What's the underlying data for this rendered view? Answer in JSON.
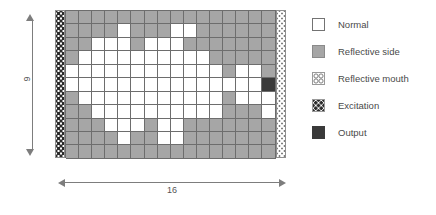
{
  "diagram": {
    "width_label": "16",
    "height_label": "9",
    "colors": {
      "normal": "#ffffff",
      "reflective_side": "#a6a6a6",
      "output": "#3a3a3a",
      "grid_line": "#6d6d6d",
      "arrow": "#7d7d7d"
    },
    "grid": {
      "columns": 16,
      "rows": 11,
      "left_strip": "excitation",
      "right_strip": "reflective-mouth",
      "legend_keys": {
        "n": "normal",
        "r": "reflective_side",
        "o": "output"
      },
      "matrix": [
        [
          "r",
          "r",
          "r",
          "r",
          "r",
          "r",
          "r",
          "r",
          "r",
          "r",
          "r",
          "r",
          "r",
          "r",
          "r",
          "r"
        ],
        [
          "r",
          "r",
          "r",
          "r",
          "n",
          "r",
          "r",
          "r",
          "n",
          "n",
          "r",
          "r",
          "r",
          "r",
          "r",
          "r"
        ],
        [
          "r",
          "r",
          "n",
          "n",
          "n",
          "r",
          "n",
          "n",
          "n",
          "r",
          "r",
          "r",
          "r",
          "r",
          "r",
          "r"
        ],
        [
          "r",
          "n",
          "n",
          "n",
          "n",
          "n",
          "n",
          "n",
          "n",
          "n",
          "n",
          "r",
          "r",
          "r",
          "r",
          "r"
        ],
        [
          "n",
          "n",
          "n",
          "n",
          "n",
          "n",
          "n",
          "n",
          "n",
          "n",
          "n",
          "n",
          "r",
          "n",
          "n",
          "r"
        ],
        [
          "n",
          "n",
          "n",
          "n",
          "n",
          "n",
          "n",
          "n",
          "n",
          "n",
          "n",
          "n",
          "n",
          "n",
          "n",
          "o"
        ],
        [
          "r",
          "n",
          "n",
          "n",
          "n",
          "n",
          "n",
          "n",
          "n",
          "n",
          "n",
          "n",
          "r",
          "n",
          "n",
          "n"
        ],
        [
          "r",
          "r",
          "n",
          "n",
          "n",
          "n",
          "n",
          "n",
          "n",
          "n",
          "n",
          "n",
          "r",
          "r",
          "r",
          "n"
        ],
        [
          "r",
          "r",
          "r",
          "n",
          "n",
          "n",
          "r",
          "n",
          "n",
          "r",
          "r",
          "r",
          "r",
          "r",
          "r",
          "r"
        ],
        [
          "r",
          "r",
          "r",
          "r",
          "n",
          "r",
          "r",
          "n",
          "n",
          "r",
          "r",
          "r",
          "r",
          "r",
          "r",
          "r"
        ],
        [
          "r",
          "r",
          "r",
          "r",
          "r",
          "r",
          "r",
          "r",
          "r",
          "r",
          "r",
          "r",
          "r",
          "r",
          "r",
          "r"
        ]
      ]
    }
  },
  "legend": {
    "items": [
      {
        "swatch": "normal-swatch",
        "label": "Normal"
      },
      {
        "swatch": "reflective-side-swatch",
        "label": "Reflective side"
      },
      {
        "swatch": "reflective-mouth-swatch",
        "label": "Reflective mouth"
      },
      {
        "swatch": "excitation-swatch",
        "label": "Excitation"
      },
      {
        "swatch": "output-swatch",
        "label": "Output"
      }
    ]
  }
}
